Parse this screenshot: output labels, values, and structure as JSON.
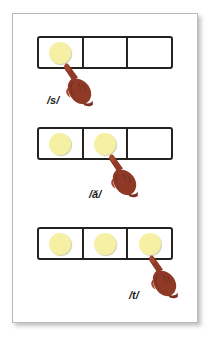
{
  "worksheet": {
    "title": "Phoneme segmentation boxes",
    "frame_color": "#b9b9b9",
    "background_color": "#ffffff",
    "box_stroke_color": "#25231f",
    "chip_color": "#f6f0a4",
    "hand_color": "#8e3a27",
    "label_color": "#1a1a1a",
    "cells_per_row": 3,
    "rows": [
      {
        "id": "row-1",
        "phoneme_label": "/s/",
        "pointing_cell_index": 1,
        "cells": [
          {
            "index": 1,
            "filled": true
          },
          {
            "index": 2,
            "filled": false
          },
          {
            "index": 3,
            "filled": false
          }
        ],
        "hand_name": "pointing-hand-icon"
      },
      {
        "id": "row-2",
        "phoneme_label": "/ă/",
        "pointing_cell_index": 2,
        "cells": [
          {
            "index": 1,
            "filled": true
          },
          {
            "index": 2,
            "filled": true
          },
          {
            "index": 3,
            "filled": false
          }
        ],
        "hand_name": "pointing-hand-icon"
      },
      {
        "id": "row-3",
        "phoneme_label": "/t/",
        "pointing_cell_index": 3,
        "cells": [
          {
            "index": 1,
            "filled": true
          },
          {
            "index": 2,
            "filled": true
          },
          {
            "index": 3,
            "filled": true
          }
        ],
        "hand_name": "pointing-hand-icon"
      }
    ]
  }
}
